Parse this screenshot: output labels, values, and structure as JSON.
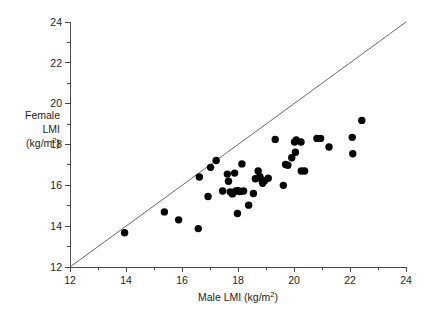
{
  "chart_data": {
    "type": "scatter",
    "title": "",
    "xlabel": "Male LMI (kg/m2)",
    "ylabel": "Female LMI (kg/m2)",
    "ylabel_lines": [
      "Female",
      "LMI",
      "(kg/m2)"
    ],
    "xlim": [
      12,
      24
    ],
    "ylim": [
      12,
      24
    ],
    "xticks": [
      12,
      14,
      16,
      18,
      20,
      22,
      24
    ],
    "yticks": [
      12,
      14,
      16,
      18,
      20,
      22,
      24
    ],
    "xtick_labels": [
      "12",
      "14",
      "16",
      "18",
      "20",
      "22",
      "24"
    ],
    "ytick_labels": [
      "12",
      "14",
      "16",
      "18",
      "20",
      "22",
      "24"
    ],
    "xminor_ticks": [
      13,
      15,
      17,
      19,
      21,
      23
    ],
    "yminor_ticks": [
      13,
      15,
      17,
      19,
      21,
      23
    ],
    "grid": false,
    "legend": null,
    "marker": "filled-circle",
    "marker_color": "#050505",
    "marker_size_px": 4.6,
    "reference_line": {
      "label": "line of identity y = x",
      "x": [
        12,
        24
      ],
      "y": [
        12,
        24
      ],
      "color": "#5a5a5a"
    },
    "points": [
      {
        "x": 13.95,
        "y": 13.68
      },
      {
        "x": 15.37,
        "y": 14.7
      },
      {
        "x": 15.88,
        "y": 14.31
      },
      {
        "x": 16.58,
        "y": 13.88
      },
      {
        "x": 16.62,
        "y": 16.41
      },
      {
        "x": 16.93,
        "y": 15.45
      },
      {
        "x": 17.02,
        "y": 16.88
      },
      {
        "x": 17.22,
        "y": 17.22
      },
      {
        "x": 17.45,
        "y": 15.72
      },
      {
        "x": 17.62,
        "y": 16.55
      },
      {
        "x": 17.66,
        "y": 16.2
      },
      {
        "x": 17.72,
        "y": 15.68
      },
      {
        "x": 17.8,
        "y": 15.58
      },
      {
        "x": 17.88,
        "y": 16.6
      },
      {
        "x": 17.92,
        "y": 15.72
      },
      {
        "x": 17.98,
        "y": 14.62
      },
      {
        "x": 18.0,
        "y": 15.74
      },
      {
        "x": 18.07,
        "y": 15.7
      },
      {
        "x": 18.14,
        "y": 17.05
      },
      {
        "x": 18.2,
        "y": 15.72
      },
      {
        "x": 18.38,
        "y": 15.03
      },
      {
        "x": 18.55,
        "y": 15.6
      },
      {
        "x": 18.62,
        "y": 16.32
      },
      {
        "x": 18.72,
        "y": 16.7
      },
      {
        "x": 18.78,
        "y": 16.42
      },
      {
        "x": 18.84,
        "y": 16.28
      },
      {
        "x": 18.88,
        "y": 16.1
      },
      {
        "x": 18.95,
        "y": 16.22
      },
      {
        "x": 19.08,
        "y": 16.35
      },
      {
        "x": 19.33,
        "y": 18.25
      },
      {
        "x": 19.62,
        "y": 16.0
      },
      {
        "x": 19.7,
        "y": 17.02
      },
      {
        "x": 19.78,
        "y": 16.98
      },
      {
        "x": 19.92,
        "y": 17.35
      },
      {
        "x": 20.02,
        "y": 18.12
      },
      {
        "x": 20.05,
        "y": 17.62
      },
      {
        "x": 20.08,
        "y": 18.22
      },
      {
        "x": 20.25,
        "y": 18.12
      },
      {
        "x": 20.26,
        "y": 16.7
      },
      {
        "x": 20.38,
        "y": 16.7
      },
      {
        "x": 20.82,
        "y": 18.3
      },
      {
        "x": 20.95,
        "y": 18.3
      },
      {
        "x": 21.25,
        "y": 17.88
      },
      {
        "x": 22.08,
        "y": 18.35
      },
      {
        "x": 22.1,
        "y": 17.55
      },
      {
        "x": 22.42,
        "y": 19.18
      }
    ]
  }
}
